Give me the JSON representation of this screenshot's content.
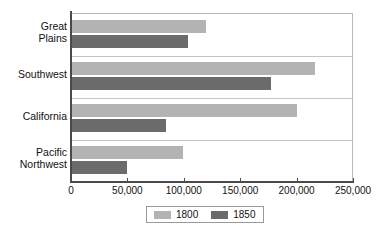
{
  "chart_data": {
    "type": "bar",
    "orientation": "horizontal",
    "title": "",
    "xlabel": "",
    "ylabel": "",
    "categories": [
      "Great\nPlains",
      "Southwest",
      "California",
      "Pacific\nNorthwest"
    ],
    "series": [
      {
        "name": "1800",
        "color": "#b3b3b3",
        "values": [
          120000,
          216000,
          200000,
          99000
        ]
      },
      {
        "name": "1850",
        "color": "#6b6b6b",
        "values": [
          104000,
          177000,
          84000,
          50000
        ]
      }
    ],
    "xlim": [
      0,
      250000
    ],
    "xticks": [
      0,
      50000,
      100000,
      150000,
      200000,
      250000
    ],
    "xtick_labels": [
      "0",
      "50,000",
      "100,000",
      "150,000",
      "200,000",
      "250,000"
    ],
    "grid": "category-separators",
    "legend_position": "bottom-center",
    "legend_entries": [
      "1800",
      "1850"
    ]
  },
  "axis": {
    "color": "#4a4a4a",
    "gridline_color": "#c4c4c4"
  }
}
